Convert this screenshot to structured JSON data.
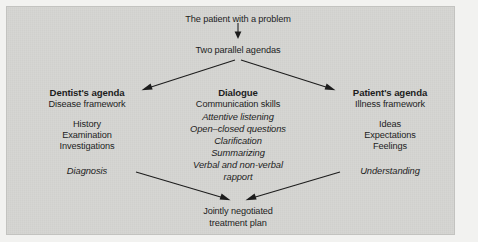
{
  "figure": {
    "title_top": "The patient with a problem",
    "node_agendas": "Two parallel agendas",
    "bottom_line1": "Jointly negotiated",
    "bottom_line2": "treatment plan",
    "background_color": "#d4d4d1",
    "text_color": "#1d1d1d",
    "arrow_color": "#1c1c1c"
  },
  "columns": {
    "left": {
      "heading": "Dentist's agenda",
      "subheading": "Disease framework",
      "items": [
        "History",
        "Examination",
        "Investigations"
      ],
      "outcome": "Diagnosis"
    },
    "center": {
      "heading": "Dialogue",
      "subheading": "Communication skills",
      "items": [
        "Attentive listening",
        "Open–closed questions",
        "Clarification",
        "Summarizing",
        "Verbal and non-verbal",
        "rapport"
      ]
    },
    "right": {
      "heading": "Patient's agenda",
      "subheading": "Illness framework",
      "items": [
        "Ideas",
        "Expectations",
        "Feelings"
      ],
      "outcome": "Understanding"
    }
  },
  "arrows": [
    {
      "name": "patient-to-agendas",
      "direction": "down"
    },
    {
      "name": "agendas-to-dentist",
      "direction": "down-left"
    },
    {
      "name": "agendas-to-patient",
      "direction": "down-right"
    },
    {
      "name": "diagnosis-to-plan",
      "direction": "down-right"
    },
    {
      "name": "understanding-to-plan",
      "direction": "down-left"
    }
  ]
}
